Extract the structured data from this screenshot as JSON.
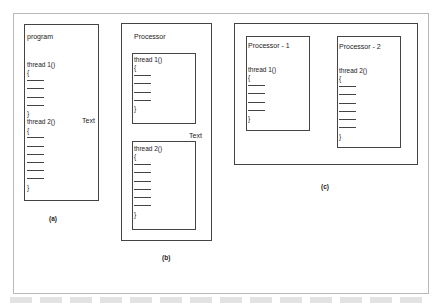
{
  "diagram": {
    "panel_a": {
      "caption": "(a)",
      "title": "program",
      "side_label": "Text",
      "threads": [
        {
          "header": "thread 1()",
          "open": "{",
          "close": "}",
          "lines": 4
        },
        {
          "header": "thread 2()",
          "open": "{",
          "close": "}",
          "lines": 6
        }
      ]
    },
    "panel_b": {
      "caption": "(b)",
      "title": "Processor",
      "side_label": "Text",
      "threads": [
        {
          "header": "thread 1()",
          "open": "{",
          "close": "}",
          "lines": 4
        },
        {
          "header": "thread 2()",
          "open": "{",
          "close": "}",
          "lines": 6
        }
      ]
    },
    "panel_c": {
      "caption": "(c)",
      "processors": [
        {
          "title": "Processor - 1",
          "header": "thread 1()",
          "open": "{",
          "close": "}",
          "lines": 4
        },
        {
          "title": "Processor - 2",
          "header": "thread 2()",
          "open": "{",
          "close": "}",
          "lines": 6
        }
      ]
    }
  },
  "colors": {
    "border": "#444444",
    "frame": "#b8b8b8",
    "text": "#222222",
    "background": "#ffffff"
  }
}
